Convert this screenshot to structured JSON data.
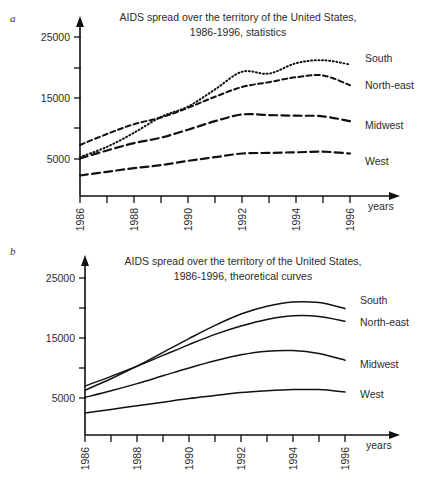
{
  "figure": {
    "panels": [
      {
        "letter": "a",
        "title_line1": "AIDS spread over the territory of the United States,",
        "title_line2": "1986-1996, statistics",
        "xlabel": "years",
        "series_labels": [
          "South",
          "North-east",
          "Midwest",
          "West"
        ]
      },
      {
        "letter": "b",
        "title_line1": "AIDS spread over the territory of the United States,",
        "title_line2": "1986-1996, theoretical curves",
        "xlabel": "years",
        "series_labels": [
          "South",
          "North-east",
          "Midwest",
          "West"
        ]
      }
    ]
  },
  "chart_data": [
    {
      "type": "line",
      "panel": "a",
      "title": "AIDS spread over the territory of the United States, 1986-1996, statistics",
      "xlabel": "years",
      "ylabel": "",
      "x": [
        1986,
        1987,
        1988,
        1989,
        1990,
        1991,
        1992,
        1993,
        1994,
        1995,
        1996
      ],
      "xlim": [
        1986,
        1996
      ],
      "ylim": [
        0,
        27000
      ],
      "yticks": [
        5000,
        10000,
        15000,
        20000,
        25000
      ],
      "ytick_labels": [
        "5000",
        "",
        "15000",
        "",
        "25000"
      ],
      "xticks": [
        1986,
        1987,
        1988,
        1989,
        1990,
        1991,
        1992,
        1993,
        1994,
        1995,
        1996
      ],
      "xtick_labels": [
        "1986",
        "",
        "1988",
        "",
        "1990",
        "",
        "1992",
        "",
        "1994",
        "",
        "1996"
      ],
      "grid": false,
      "legend_position": "right-inline",
      "series": [
        {
          "name": "South",
          "style": "dotted",
          "values": [
            5300,
            7000,
            9300,
            11900,
            13600,
            16400,
            19300,
            19000,
            20700,
            21200,
            20500
          ]
        },
        {
          "name": "North-east",
          "style": "dashed",
          "values": [
            7300,
            9100,
            10700,
            11800,
            13400,
            15200,
            16800,
            17600,
            18400,
            18700,
            17100
          ]
        },
        {
          "name": "Midwest",
          "style": "dashed-long",
          "values": [
            5100,
            6400,
            7600,
            8500,
            9800,
            11200,
            12300,
            12200,
            12100,
            12000,
            11200
          ]
        },
        {
          "name": "West",
          "style": "dashed-long",
          "values": [
            2300,
            2900,
            3500,
            4000,
            4700,
            5300,
            5900,
            6000,
            6100,
            6200,
            5900
          ]
        }
      ]
    },
    {
      "type": "line",
      "panel": "b",
      "title": "AIDS spread over the territory of the United States, 1986-1996, theoretical curves",
      "xlabel": "years",
      "ylabel": "",
      "x": [
        1986,
        1987,
        1988,
        1989,
        1990,
        1991,
        1992,
        1993,
        1994,
        1995,
        1996
      ],
      "xlim": [
        1986,
        1996
      ],
      "ylim": [
        0,
        27000
      ],
      "yticks": [
        5000,
        10000,
        15000,
        20000,
        25000
      ],
      "ytick_labels": [
        "5000",
        "",
        "15000",
        "",
        "25000"
      ],
      "xticks": [
        1986,
        1987,
        1988,
        1989,
        1990,
        1991,
        1992,
        1993,
        1994,
        1995,
        1996
      ],
      "xtick_labels": [
        "1986",
        "",
        "1988",
        "",
        "1990",
        "",
        "1992",
        "",
        "1994",
        "",
        "1996"
      ],
      "grid": false,
      "legend_position": "right-inline",
      "series": [
        {
          "name": "South",
          "style": "solid",
          "values": [
            6300,
            8200,
            10300,
            12600,
            14900,
            17100,
            19000,
            20300,
            21000,
            20900,
            19900
          ]
        },
        {
          "name": "North-east",
          "style": "solid",
          "values": [
            7000,
            8600,
            10300,
            12100,
            13900,
            15600,
            17000,
            18100,
            18700,
            18600,
            17800
          ]
        },
        {
          "name": "Midwest",
          "style": "solid",
          "values": [
            5100,
            6200,
            7400,
            8700,
            10000,
            11200,
            12200,
            12800,
            12900,
            12400,
            11300
          ]
        },
        {
          "name": "West",
          "style": "solid",
          "values": [
            2500,
            3100,
            3700,
            4300,
            4900,
            5400,
            5900,
            6200,
            6400,
            6400,
            6000
          ]
        }
      ]
    }
  ]
}
